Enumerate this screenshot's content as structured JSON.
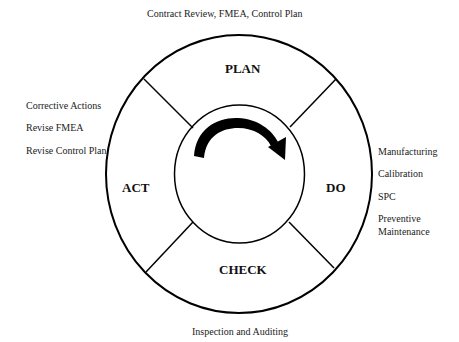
{
  "diagram": {
    "type": "PDCA cycle",
    "phases": {
      "plan": "PLAN",
      "do": "DO",
      "check": "CHECK",
      "act": "ACT"
    },
    "annotations": {
      "plan": "Contract Review,  FMEA, Control Plan",
      "act": [
        "Corrective Actions",
        "Revise FMEA",
        "Revise Control Plan"
      ],
      "do": [
        "Manufacturing",
        "Calibration",
        "SPC",
        "Preventive",
        "Maintenance"
      ],
      "check": "Inspection and Auditing"
    },
    "center_icon": "clockwise-arrow-icon",
    "colors": {
      "stroke": "#000000",
      "background": "#ffffff"
    }
  }
}
